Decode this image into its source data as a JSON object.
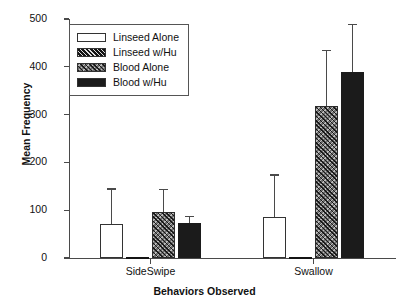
{
  "chart_data": {
    "type": "bar",
    "title": "",
    "xlabel": "Behaviors Observed",
    "ylabel": "Mean Frequency",
    "categories": [
      "SideSwipe",
      "Swallow"
    ],
    "ylim": [
      0,
      500
    ],
    "yticks": [
      0,
      100,
      200,
      300,
      400,
      500
    ],
    "ytick_labels": [
      "0",
      "100",
      "200",
      "300",
      "400",
      "500"
    ],
    "grid": false,
    "legend_position": "upper left",
    "error_bars": "upper only",
    "series": [
      {
        "name": "Linseed Alone",
        "fill": "open",
        "values": [
          71,
          86
        ],
        "errors_upper": [
          146,
          175
        ]
      },
      {
        "name": "Linseed w/Hu",
        "fill": "dark-hatch",
        "values": [
          2,
          0
        ],
        "errors_upper": [
          2,
          0
        ]
      },
      {
        "name": "Blood Alone",
        "fill": "grey-crosshatch",
        "values": [
          96,
          318
        ],
        "errors_upper": [
          145,
          435
        ]
      },
      {
        "name": "Blood w/Hu",
        "fill": "solid-black",
        "values": [
          73,
          390
        ],
        "errors_upper": [
          88,
          490
        ]
      }
    ]
  },
  "legend": {
    "items": [
      {
        "label": "Linseed Alone",
        "swatch": "open-swatch"
      },
      {
        "label": "Linseed w/Hu",
        "swatch": "dark-hatch-swatch"
      },
      {
        "label": "Blood Alone",
        "swatch": "grey-crosshatch-swatch"
      },
      {
        "label": "Blood w/Hu",
        "swatch": "solid-black-swatch"
      }
    ]
  },
  "axes": {
    "y_title": "Mean Frequency",
    "x_title": "Behaviors Observed",
    "y_tick_labels": [
      "500",
      "400",
      "300",
      "200",
      "100",
      "0"
    ],
    "x_tick_labels": [
      "SideSwipe",
      "Swallow"
    ]
  },
  "colors": {
    "axis": "#4a4a4a",
    "bar_outline": "#333333",
    "solid_fill": "#1b1b1b",
    "grey_fill": "#6f6f6f",
    "background": "#ffffff"
  }
}
